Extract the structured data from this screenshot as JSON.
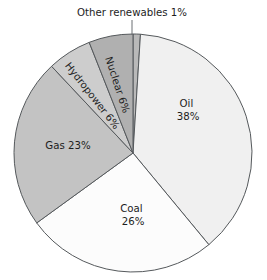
{
  "chart_data": {
    "type": "pie",
    "title": "",
    "xlabel": "",
    "ylabel": "",
    "legend_position": "none",
    "grid": false,
    "total_percent": 100,
    "start_angle_deg": 0,
    "direction": "clockwise",
    "center": {
      "x": 133,
      "y": 153
    },
    "radius": 119,
    "categories": [
      "Other renewables",
      "Oil",
      "Coal",
      "Gas",
      "Hydropower",
      "Nuclear"
    ],
    "values": [
      1,
      38,
      26,
      23,
      6,
      6
    ],
    "slices": [
      {
        "name": "other-renewables",
        "label": "Other renewables 1%",
        "category": "Other renewables",
        "value": 1,
        "value_text": "1%",
        "color": "#b9b9b9",
        "label_placement": "outside-callout",
        "start_deg": 0,
        "end_deg": 3.6,
        "callout_x": 132,
        "callout_y": 16,
        "leader_x1": 132,
        "leader_y1": 20,
        "leader_x2": 132,
        "leader_y2": 35
      },
      {
        "name": "oil",
        "label": "Oil",
        "category": "Oil",
        "value": 38,
        "value_text": "38%",
        "color": "#f0f0f0",
        "label_placement": "inside-horizontal",
        "start_deg": 3.6,
        "end_deg": 140.4,
        "label_x": 188,
        "label_y": 104,
        "label_line2_dy": 13
      },
      {
        "name": "coal",
        "label": "Coal",
        "category": "Coal",
        "value": 26,
        "value_text": "26%",
        "color": "#fcfcfc",
        "label_placement": "inside-horizontal",
        "start_deg": 140.4,
        "end_deg": 234.0,
        "label_x": 133,
        "label_y": 209,
        "label_line2_dy": 13
      },
      {
        "name": "gas",
        "label": "Gas 23%",
        "category": "Gas",
        "value": 23,
        "value_text": "23%",
        "color": "#c3c3c3",
        "label_placement": "inside-horizontal",
        "start_deg": 234.0,
        "end_deg": 316.8,
        "label_x": 68,
        "label_y": 146
      },
      {
        "name": "hydropower",
        "label": "Hydropower 6%",
        "category": "Hydropower",
        "value": 6,
        "value_text": "6%",
        "color": "#cdcdcd",
        "label_placement": "inside-rotated",
        "start_deg": 316.8,
        "end_deg": 338.4,
        "label_x": 92,
        "label_y": 96,
        "rotation_deg": 52
      },
      {
        "name": "nuclear",
        "label": "Nuclear 6%",
        "category": "Nuclear",
        "value": 6,
        "value_text": "6%",
        "color": "#b0b0b0",
        "label_placement": "inside-rotated",
        "start_deg": 338.4,
        "end_deg": 360.0,
        "label_x": 117,
        "label_y": 85,
        "rotation_deg": 72
      }
    ]
  },
  "labels": {
    "other_renewables": "Other renewables 1%",
    "oil_name": "Oil",
    "oil_value": "38%",
    "coal_name": "Coal",
    "coal_value": "26%",
    "gas": "Gas 23%",
    "hydropower": "Hydropower 6%",
    "nuclear": "Nuclear 6%"
  }
}
